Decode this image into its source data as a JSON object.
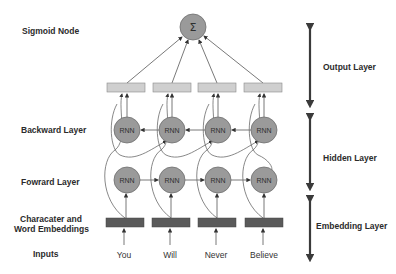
{
  "left_labels": {
    "sigmoid": "Sigmoid Node",
    "backward": "Backward Layer",
    "forward": "Fowrard Layer",
    "embeddings_line1": "Characater and",
    "embeddings_line2": "Word Embeddings",
    "inputs": "Inputs"
  },
  "right_labels": {
    "output": "Output Layer",
    "hidden": "Hidden Layer",
    "embedding": "Embedding Layer"
  },
  "sigmoid_node": {
    "symbol": "Σ"
  },
  "rnn_label": "RNN",
  "inputs": [
    "You",
    "Will",
    "Never",
    "Believe"
  ],
  "colors": {
    "node_fill": "#9a9a9a",
    "node_stroke": "#6e6e6e",
    "output_box_fill": "#cfcfcf",
    "embedding_box_fill": "#5a5a5a",
    "line": "#6a6a6a",
    "bracket": "#3a3a3a"
  }
}
